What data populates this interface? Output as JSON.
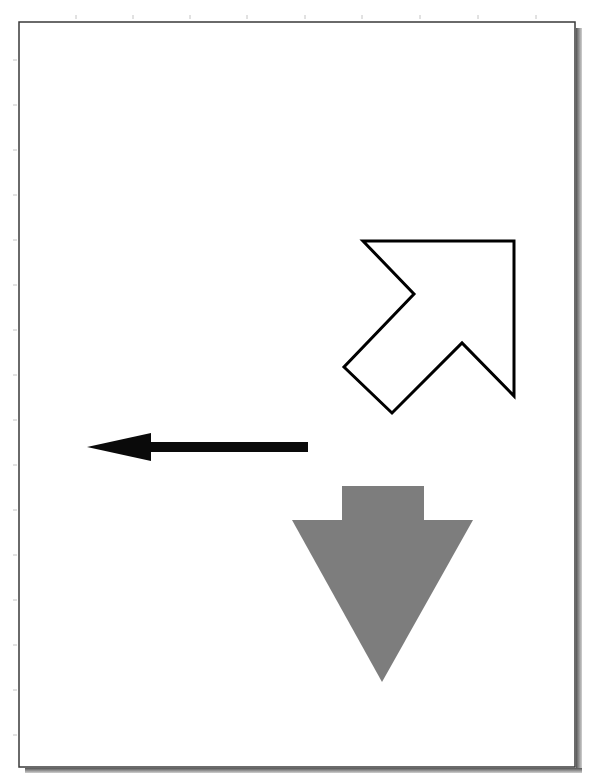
{
  "page": {
    "width": 596,
    "height": 782,
    "background": "#ffffff",
    "border": {
      "x": 19,
      "y": 22,
      "width": 556,
      "height": 745,
      "color": "#3a3a3a",
      "shadow_color": "#6a6a6a"
    },
    "top_ticks_x": [
      76,
      133,
      190,
      247,
      305,
      362,
      420,
      478,
      536
    ],
    "left_ticks_y": [
      60,
      105,
      150,
      195,
      240,
      285,
      330,
      375,
      420,
      465,
      510,
      555,
      600,
      645,
      690,
      735
    ]
  },
  "shapes": {
    "outline_arrow": {
      "description": "outlined arrow pointing up-right",
      "points": "363,241 514,241 514,396 462,343 392,413 344,367 414,294",
      "stroke": "#000000",
      "fill": "#ffffff",
      "stroke_width": 3
    },
    "black_arrow": {
      "description": "solid black arrow pointing left",
      "shaft": {
        "x": 149,
        "y": 442,
        "width": 159,
        "height": 10
      },
      "head_points": "87,447 151,433 151,461",
      "fill": "#0a0a0a"
    },
    "gray_arrow": {
      "description": "solid gray arrow pointing down",
      "stem": {
        "x": 342,
        "y": 486,
        "width": 82,
        "height": 35
      },
      "head_points": "292,520 473,520 382,682",
      "fill": "#7d7d7d"
    }
  }
}
